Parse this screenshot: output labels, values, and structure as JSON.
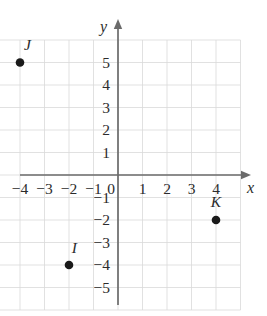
{
  "figure": {
    "kind": "coordinate-plane",
    "background_color": "#ffffff",
    "grid_color": "#d9d9d9",
    "axis_color": "#6b6b6b",
    "point_color": "#1a1a1a",
    "label_color": "#2b2b2b"
  },
  "axes": {
    "x_name": "x",
    "y_name": "y",
    "origin_label": "0"
  },
  "chart_data": {
    "type": "scatter",
    "title": "",
    "xlabel": "x",
    "ylabel": "y",
    "xlim": [
      -5,
      5
    ],
    "ylim": [
      -6,
      6
    ],
    "grid": true,
    "legend": "none",
    "x_ticks": [
      "-4",
      "-3",
      "-2",
      "-1",
      "0",
      "1",
      "2",
      "3",
      "4"
    ],
    "x_tick_values": [
      -4,
      -3,
      -2,
      -1,
      0,
      1,
      2,
      3,
      4
    ],
    "y_ticks": [
      "5",
      "4",
      "3",
      "2",
      "1",
      "-1",
      "-2",
      "-3",
      "-4",
      "-5"
    ],
    "y_tick_values": [
      5,
      4,
      3,
      2,
      1,
      -1,
      -2,
      -3,
      -4,
      -5
    ],
    "points": [
      {
        "label": "J",
        "x": -4,
        "y": 5,
        "label_dx": 0.3,
        "label_dy": 0.95
      },
      {
        "label": "I",
        "x": -2,
        "y": -4,
        "label_dx": 0.22,
        "label_dy": 0.95
      },
      {
        "label": "K",
        "x": 4,
        "y": -2,
        "label_dx": 0.0,
        "label_dy": 0.98
      }
    ]
  }
}
